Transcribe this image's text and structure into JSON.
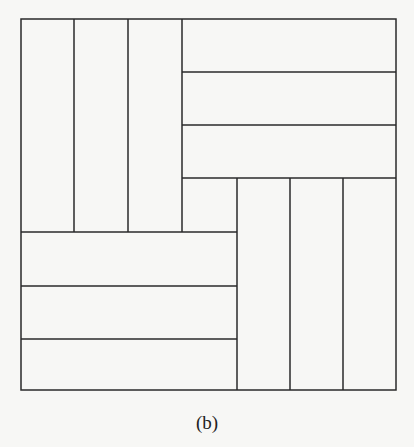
{
  "figure": {
    "caption": "(b)",
    "stroke_color": "#2a2a2a",
    "background_color": "#f7f7f5",
    "outer_box": {
      "x": 21,
      "y": 19,
      "width": 375,
      "height": 371
    },
    "blocks": [
      {
        "name": "top-left-vertical-strips",
        "orientation": "vertical",
        "strip_count": 3
      },
      {
        "name": "top-right-horizontal-strips",
        "orientation": "horizontal",
        "strip_count": 3
      },
      {
        "name": "bottom-left-horizontal-strips",
        "orientation": "horizontal",
        "strip_count": 3
      },
      {
        "name": "bottom-right-vertical-strips",
        "orientation": "vertical",
        "strip_count": 3
      }
    ],
    "center_square": {
      "x": 182,
      "y": 178,
      "size": 55
    }
  }
}
